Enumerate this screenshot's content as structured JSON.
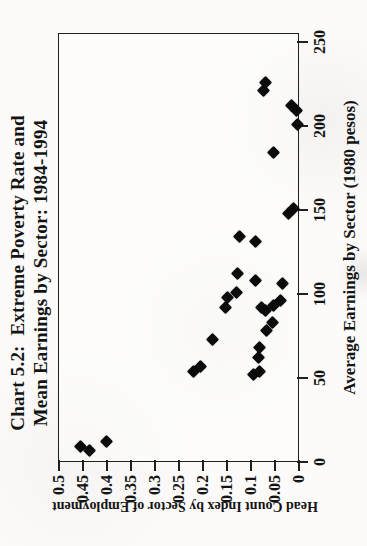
{
  "chart_data": {
    "type": "scatter",
    "title_line1": "Chart 5.2:  Extreme Poverty Rate and",
    "title_line2": "Mean Earnings by Sector: 1984-1994",
    "xlabel": "Average Earnings by Sector (1980 pesos)",
    "ylabel": "Head Count Index by Sector of Employment",
    "xlim": [
      0,
      250
    ],
    "ylim": [
      0,
      0.5
    ],
    "xticks": [
      "0",
      "50",
      "100",
      "150",
      "200",
      "250"
    ],
    "yticks": [
      "0",
      "0.05",
      "0.1",
      "0.15",
      "0.2",
      "0.25",
      "0.3",
      "0.35",
      "0.4",
      "0.45",
      "0.5"
    ],
    "grid": false,
    "legend": "none",
    "marker": "diamond",
    "marker_color": "#0b0b0b",
    "orientation": "rotated-90-ccw-on-portrait-page",
    "points": [
      [
        7,
        0.435
      ],
      [
        9,
        0.455
      ],
      [
        12,
        0.4
      ],
      [
        52,
        0.095
      ],
      [
        54,
        0.083
      ],
      [
        54,
        0.22
      ],
      [
        57,
        0.205
      ],
      [
        62,
        0.085
      ],
      [
        68,
        0.082
      ],
      [
        73,
        0.18
      ],
      [
        78,
        0.068
      ],
      [
        83,
        0.055
      ],
      [
        90,
        0.069
      ],
      [
        92,
        0.079
      ],
      [
        93,
        0.052
      ],
      [
        96,
        0.038
      ],
      [
        92,
        0.152
      ],
      [
        98,
        0.148
      ],
      [
        101,
        0.13
      ],
      [
        106,
        0.035
      ],
      [
        108,
        0.09
      ],
      [
        112,
        0.127
      ],
      [
        131,
        0.09
      ],
      [
        134,
        0.123
      ],
      [
        148,
        0.022
      ],
      [
        151,
        0.012
      ],
      [
        184,
        0.054
      ],
      [
        201,
        0.003
      ],
      [
        209,
        0.006
      ],
      [
        212,
        0.016
      ],
      [
        221,
        0.073
      ],
      [
        226,
        0.069
      ]
    ]
  }
}
